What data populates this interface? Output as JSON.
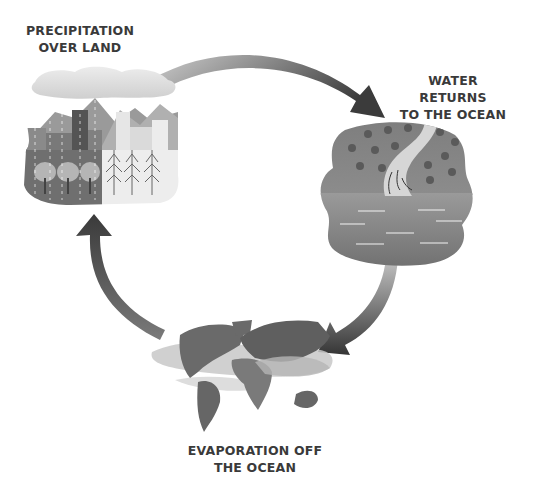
{
  "diagram": {
    "type": "cycle",
    "stages": [
      {
        "id": "precipitation",
        "label_lines": [
          "PRECIPITATION",
          "OVER LAND"
        ],
        "illustration": "city-mountains-forest-under-rain-cloud"
      },
      {
        "id": "return",
        "label_lines": [
          "WATER RETURNS",
          "TO THE OCEAN"
        ],
        "illustration": "river-through-forest-into-ocean"
      },
      {
        "id": "evaporation",
        "label_lines": [
          "EVAPORATION OFF",
          "THE OCEAN"
        ],
        "illustration": "world-map-with-evaporation-bands"
      }
    ],
    "arrows": [
      {
        "from": "precipitation",
        "to": "return",
        "direction": "clockwise"
      },
      {
        "from": "return",
        "to": "evaporation",
        "direction": "clockwise"
      },
      {
        "from": "evaporation",
        "to": "precipitation",
        "direction": "clockwise"
      }
    ],
    "colors": {
      "text": "#3a3a3a",
      "arrow_dark": "#3d3d3d",
      "arrow_light": "#bdbdbd",
      "land_dark": "#6a6a6a",
      "water": "#8a8a8a",
      "cloud": "#d8d8d8",
      "background": "#ffffff"
    }
  }
}
